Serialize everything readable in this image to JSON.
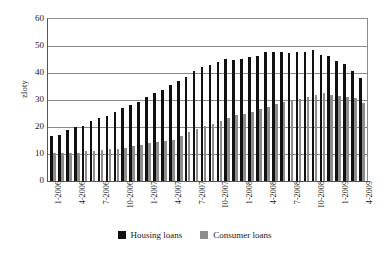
{
  "chart_data": {
    "type": "bar",
    "title": "",
    "xlabel": "",
    "ylabel": "zloty",
    "ylim": [
      0,
      60
    ],
    "yticks": [
      0,
      10,
      20,
      30,
      40,
      50,
      60
    ],
    "grid": true,
    "legend_position": "bottom",
    "tick_categories": [
      "1-2006",
      "4-2006",
      "7-2006",
      "10-2006",
      "1-2007",
      "4-2007",
      "7-2007",
      "10-2007",
      "1-2008",
      "4-2008",
      "7-2008",
      "10-2008",
      "1-2009",
      "4-2009"
    ],
    "categories": [
      "1-2006",
      "2-2006",
      "3-2006",
      "4-2006",
      "5-2006",
      "6-2006",
      "7-2006",
      "8-2006",
      "9-2006",
      "10-2006",
      "11-2006",
      "12-2006",
      "1-2007",
      "2-2007",
      "3-2007",
      "4-2007",
      "5-2007",
      "6-2007",
      "7-2007",
      "8-2007",
      "9-2007",
      "10-2007",
      "11-2007",
      "12-2007",
      "1-2008",
      "2-2008",
      "3-2008",
      "4-2008",
      "5-2008",
      "6-2008",
      "7-2008",
      "8-2008",
      "9-2008",
      "10-2008",
      "11-2008",
      "12-2008",
      "1-2009",
      "2-2009",
      "3-2009",
      "4-2009"
    ],
    "series": [
      {
        "name": "Housing loans",
        "color": "#111111",
        "values": [
          16.7,
          17.1,
          18.9,
          20.1,
          20.5,
          22.1,
          23.2,
          24.1,
          25.5,
          27.0,
          28.0,
          29.4,
          31.1,
          32.5,
          33.8,
          35.4,
          36.9,
          38.6,
          40.8,
          42.2,
          43.1,
          43.9,
          45.1,
          45.0,
          45.2,
          45.8,
          46.2,
          47.7,
          47.6,
          47.6,
          47.5,
          47.6,
          47.8,
          48.5,
          46.8,
          46.2,
          44.6,
          43.2,
          40.6,
          38.0
        ]
      },
      {
        "name": "Consumer loans",
        "color": "#8d8d8d",
        "values": [
          10.3,
          10.3,
          10.3,
          10.3,
          11.1,
          11.3,
          11.6,
          11.8,
          12.0,
          12.4,
          13.0,
          13.3,
          13.9,
          14.5,
          15.0,
          15.3,
          16.8,
          18.0,
          19.1,
          20.2,
          21.2,
          22.1,
          23.2,
          24.5,
          24.8,
          25.6,
          26.5,
          27.4,
          28.6,
          29.2,
          29.6,
          30.5,
          31.1,
          32.0,
          32.7,
          32.0,
          31.5,
          31.3,
          30.6,
          29.0
        ]
      }
    ]
  },
  "legend": {
    "items": [
      {
        "label": "Housing loans",
        "color": "#111111"
      },
      {
        "label": "Consumer loans",
        "color": "#8d8d8d"
      }
    ]
  }
}
